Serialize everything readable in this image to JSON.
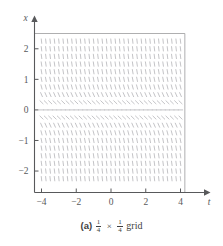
{
  "figure": {
    "caption_label": "(a)",
    "caption_text": "grid",
    "caption_fraction_num": "1",
    "caption_fraction_den": "4",
    "caption_times": "×"
  },
  "chart_data": {
    "type": "scatter",
    "plot_kind": "direction-field",
    "title": "",
    "subtitle": "",
    "xlabel": "t",
    "ylabel": "x",
    "xlim": [
      -4.5,
      4.5
    ],
    "ylim": [
      -2.5,
      2.5
    ],
    "frame_xlim": [
      -4.25,
      4.25
    ],
    "frame_ylim": [
      -2.375,
      2.5
    ],
    "grid": false,
    "legend": null,
    "xticks": [
      -4,
      -2,
      0,
      2,
      4
    ],
    "xtick_labels": [
      "−4",
      "−2",
      "0",
      "2",
      "4"
    ],
    "yticks": [
      2,
      1,
      0,
      -1,
      -2
    ],
    "ytick_labels": [
      "2",
      "1",
      "0",
      "−1",
      "−2"
    ],
    "grid_spacing_t": 0.25,
    "grid_spacing_x": 0.25,
    "x_axis_arrow": true,
    "y_axis_arrow": true,
    "field_domain_t": [
      -4.0,
      4.0
    ],
    "field_domain_x": [
      -2.25,
      2.25
    ],
    "slope_rule": "dx/dt depends only on x; slope = 0 at x = 0 and grows steeply negative as |x| increases",
    "slope_samples": [
      {
        "x": 2.25,
        "slope": -5.0
      },
      {
        "x": 2.0,
        "slope": -4.6
      },
      {
        "x": 1.75,
        "slope": -4.2
      },
      {
        "x": 1.5,
        "slope": -3.8
      },
      {
        "x": 1.25,
        "slope": -3.3
      },
      {
        "x": 1.0,
        "slope": -2.8
      },
      {
        "x": 0.75,
        "slope": -2.1
      },
      {
        "x": 0.5,
        "slope": -1.3
      },
      {
        "x": 0.25,
        "slope": -0.55
      },
      {
        "x": 0.0,
        "slope": 0.0
      },
      {
        "x": -0.25,
        "slope": -0.55
      },
      {
        "x": -0.5,
        "slope": -1.3
      },
      {
        "x": -0.75,
        "slope": -2.1
      },
      {
        "x": -1.0,
        "slope": -2.8
      },
      {
        "x": -1.25,
        "slope": -3.3
      },
      {
        "x": -1.5,
        "slope": -3.8
      },
      {
        "x": -1.75,
        "slope": -4.2
      },
      {
        "x": -2.0,
        "slope": -4.6
      },
      {
        "x": -2.25,
        "slope": -5.0
      }
    ],
    "colors": {
      "axis": "#58595b",
      "frame": "#9a9a9c",
      "slope_marks": "#b9b9bd",
      "background": "#ffffff",
      "text": "#3f3f41"
    }
  }
}
